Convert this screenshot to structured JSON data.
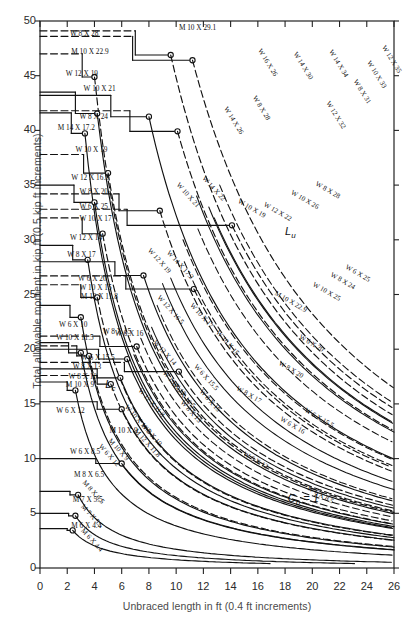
{
  "chart_data": {
    "type": "line",
    "title": "",
    "xlabel": "Unbraced length in ft (0.4 ft increments)",
    "ylabel": "Total allowable moment in kip ft (0.5 kip ft increments)",
    "xlim": [
      0,
      26
    ],
    "ylim": [
      0,
      50
    ],
    "xticks": [
      0,
      2,
      4,
      6,
      8,
      10,
      12,
      14,
      16,
      18,
      20,
      22,
      24,
      26
    ],
    "yticks": [
      0,
      5,
      10,
      15,
      20,
      25,
      30,
      35,
      40,
      45,
      50
    ],
    "grid": false,
    "legend": false,
    "annotations": [
      {
        "text": "C",
        "sub": "b",
        "suffix": " = 1",
        "x": 18.2,
        "y": 6.2,
        "name": "cb-annotation"
      },
      {
        "text": "L",
        "sub": "u",
        "x": 18.0,
        "y": 30.6,
        "name": "lu-annotation"
      },
      {
        "text": "L",
        "sub": "c",
        "x": 5.0,
        "y": 16.4,
        "name": "lc-annotation"
      }
    ],
    "series": [
      {
        "name": "W 8 X 28",
        "style": "dashed",
        "moment": 48.6,
        "lc": 6.8,
        "lu": 11.2,
        "label_x": 2.2,
        "label_y": 48.6
      },
      {
        "name": "M 10 X 22.9",
        "style": "dashed",
        "moment": 47.0,
        "lc": 3.1,
        "lu": 4.0,
        "label_x": 2.3,
        "label_y": 47.0
      },
      {
        "name": "M 10 X 29.1",
        "style": "dashed",
        "moment": 49.1,
        "lc": 7.0,
        "lu": 9.6,
        "label_x": 10.2,
        "label_y": 49.2
      },
      {
        "name": "W 12 X 19",
        "style": "solid",
        "moment": 43.5,
        "lc": 2.6,
        "lu": 4.2,
        "label_x": 1.9,
        "label_y": 45.0
      },
      {
        "name": "W 10 X 21",
        "style": "solid",
        "moment": 43.2,
        "lc": 5.2,
        "lu": 8.0,
        "label_x": 3.2,
        "label_y": 43.6
      },
      {
        "name": "W 8 X 24",
        "style": "dashed",
        "moment": 41.8,
        "lc": 6.6,
        "lu": 10.1,
        "label_x": 2.9,
        "label_y": 41.0
      },
      {
        "name": "M 14 X 17.2",
        "style": "solid",
        "moment": 41.6,
        "lc": 2.3,
        "lu": 3.3,
        "label_x": 1.3,
        "label_y": 40.0
      },
      {
        "name": "W 10 X 19",
        "style": "dashed",
        "moment": 37.8,
        "lc": 3.2,
        "lu": 5.0,
        "label_x": 2.6,
        "label_y": 38.0
      },
      {
        "name": "W 12 X 16.5",
        "style": "solid",
        "moment": 35.0,
        "lc": 2.5,
        "lu": 4.0,
        "label_x": 2.3,
        "label_y": 35.5
      },
      {
        "name": "W 8 X 20",
        "style": "dashed",
        "moment": 34.2,
        "lc": 5.8,
        "lu": 8.8,
        "label_x": 2.9,
        "label_y": 34.2
      },
      {
        "name": "W 6 X 25",
        "style": "dashed",
        "moment": 32.8,
        "lc": 6.4,
        "lu": 14.1,
        "label_x": 2.9,
        "label_y": 32.8
      },
      {
        "name": "W 10 X 17",
        "style": "dashed",
        "moment": 32.0,
        "lc": 3.1,
        "lu": 4.6,
        "label_x": 2.9,
        "label_y": 31.7
      },
      {
        "name": "W 12 X 14",
        "style": "solid",
        "moment": 29.5,
        "lc": 2.4,
        "lu": 3.5,
        "label_x": 2.2,
        "label_y": 30.0
      },
      {
        "name": "W 8 X 17",
        "style": "solid",
        "moment": 28.0,
        "lc": 5.5,
        "lu": 7.6,
        "label_x": 2.0,
        "label_y": 28.4
      },
      {
        "name": "W 6 X 20",
        "style": "dashed",
        "moment": 26.7,
        "lc": 6.3,
        "lu": 11.3,
        "label_x": 2.8,
        "label_y": 26.2
      },
      {
        "name": "W 10 X 15",
        "style": "dashed",
        "moment": 25.9,
        "lc": 3.0,
        "lu": 4.2,
        "label_x": 2.9,
        "label_y": 25.4
      },
      {
        "name": "M 12 X 11.8",
        "style": "solid",
        "moment": 24.0,
        "lc": 2.2,
        "lu": 3.0,
        "label_x": 3.0,
        "label_y": 24.6
      },
      {
        "name": "W 6 X 16",
        "style": "dashed",
        "moment": 21.2,
        "lc": 4.4,
        "lu": 7.1,
        "label_x": 5.5,
        "label_y": 21.2
      },
      {
        "name": "W 6 X 10",
        "style": "solid",
        "moment": 20.6,
        "lc": 2.1,
        "lu": 3.0,
        "label_x": 1.4,
        "label_y": 22.0
      },
      {
        "name": "W 10 X 11.5",
        "style": "dashed",
        "moment": 20.3,
        "lc": 2.7,
        "lu": 3.6,
        "label_x": 1.2,
        "label_y": 20.8
      },
      {
        "name": "W 8 X 15",
        "style": "solid",
        "moment": 20.0,
        "lc": 4.3,
        "lu": 6.4,
        "label_x": 4.6,
        "label_y": 21.4
      },
      {
        "name": "W 6 X 15.5",
        "style": "dashed",
        "moment": 18.8,
        "lc": 6.2,
        "lu": 10.2,
        "label_x": 3.0,
        "label_y": 19.0
      },
      {
        "name": "W 8 X 13",
        "style": "solid",
        "moment": 18.2,
        "lc": 4.2,
        "lu": 5.9,
        "label_x": 2.4,
        "label_y": 18.2
      },
      {
        "name": "W 8 X 10",
        "style": "dashed",
        "moment": 17.6,
        "lc": 4.2,
        "lu": 5.2,
        "label_x": 2.1,
        "label_y": 17.3
      },
      {
        "name": "M 10 X 9",
        "style": "solid",
        "moment": 17.0,
        "lc": 2.0,
        "lu": 2.6,
        "label_x": 1.9,
        "label_y": 16.5
      },
      {
        "name": "W 6 X 12",
        "style": "solid",
        "moment": 15.2,
        "lc": 4.2,
        "lu": 6.0,
        "label_x": 1.2,
        "label_y": 14.2
      },
      {
        "name": "W 6 X 8.5",
        "style": "solid",
        "moment": 10.0,
        "lc": 4.1,
        "lu": 6.0,
        "label_x": 2.2,
        "label_y": 10.4
      },
      {
        "name": "M 8 X 6.5",
        "style": "solid",
        "moment": 7.0,
        "lc": 2.2,
        "lu": 2.8,
        "label_x": 2.5,
        "label_y": 8.3
      },
      {
        "name": "M 7 X 5.5",
        "style": "solid",
        "moment": 5.0,
        "lc": 2.1,
        "lu": 2.6,
        "label_x": 2.4,
        "label_y": 6.0
      },
      {
        "name": "M 6 X 4.4",
        "style": "solid",
        "moment": 3.6,
        "lc": 2.0,
        "lu": 2.4,
        "label_x": 2.3,
        "label_y": 3.7
      },
      {
        "name": "M 10 X 9 (curve)",
        "style": "solid",
        "moment": 0,
        "lc": 0,
        "lu": 0,
        "label_x": 5.1,
        "label_y": 12.3
      },
      {
        "name": "W 16 X 26",
        "style": "solid",
        "curve_only": true,
        "label_x": 16.0,
        "label_y": 47.3
      },
      {
        "name": "W 14 X 30",
        "style": "solid",
        "curve_only": true,
        "label_x": 18.6,
        "label_y": 47.0
      },
      {
        "name": "W 14 X 34",
        "style": "dashed",
        "curve_only": true,
        "label_x": 21.2,
        "label_y": 47.2
      },
      {
        "name": "W 12 X 35",
        "style": "dashed",
        "curve_only": true,
        "label_x": 25.1,
        "label_y": 47.6
      },
      {
        "name": "W 10 X 33",
        "style": "solid",
        "curve_only": true,
        "label_x": 24.0,
        "label_y": 46.2
      },
      {
        "name": "W 8 X 31",
        "style": "solid",
        "curve_only": true,
        "label_x": 23.0,
        "label_y": 44.5
      },
      {
        "name": "W 12 X 32",
        "style": "dashed",
        "curve_only": true,
        "label_x": 21.0,
        "label_y": 42.5
      },
      {
        "name": "W 8 X 28",
        "style": "solid",
        "curve_only": true,
        "label_x": 15.6,
        "label_y": 43.0
      },
      {
        "name": "W 14 X 26",
        "style": "dashed",
        "curve_only": true,
        "label_x": 13.5,
        "label_y": 42.0
      },
      {
        "name": "W 10 X 21 (c)",
        "style": "solid",
        "curve_only": true,
        "label_x": 10.0,
        "label_y": 35.0
      },
      {
        "name": "W 14 X 22",
        "style": "solid",
        "curve_only": true,
        "label_x": 11.9,
        "label_y": 35.6
      },
      {
        "name": "W 10 X 19 (c)",
        "style": "dashed",
        "curve_only": true,
        "label_x": 14.5,
        "label_y": 33.4
      },
      {
        "name": "W 12 X 22",
        "style": "solid",
        "curve_only": true,
        "label_x": 16.4,
        "label_y": 33.1
      },
      {
        "name": "W 8 X 28 (c2)",
        "style": "solid",
        "curve_only": true,
        "label_x": 20.2,
        "label_y": 35.0
      },
      {
        "name": "W 10 X 26",
        "style": "dashed",
        "curve_only": true,
        "label_x": 18.4,
        "label_y": 34.2
      },
      {
        "name": "W 6 X 25 (c)",
        "style": "dashed",
        "curve_only": true,
        "label_x": 22.4,
        "label_y": 27.4
      },
      {
        "name": "W 8 X 24 (c)",
        "style": "solid",
        "curve_only": true,
        "label_x": 21.3,
        "label_y": 26.7
      },
      {
        "name": "W 10 X 25",
        "style": "dashed",
        "curve_only": true,
        "label_x": 20.0,
        "label_y": 25.8
      },
      {
        "name": "M 10 X 22.9 (c)",
        "style": "dashed",
        "curve_only": true,
        "label_x": 17.2,
        "label_y": 25.0
      },
      {
        "name": "W 6 X 20 (c)",
        "style": "solid",
        "curve_only": true,
        "label_x": 19.0,
        "label_y": 21.0
      },
      {
        "name": "W 8 X 20 (c)",
        "style": "dashed",
        "curve_only": true,
        "label_x": 17.5,
        "label_y": 18.6
      },
      {
        "name": "W 8 X 17 (c)",
        "style": "solid",
        "curve_only": true,
        "label_x": 14.4,
        "label_y": 16.3
      },
      {
        "name": "W 6 X 15.5 (c)",
        "style": "solid",
        "curve_only": true,
        "label_x": 19.4,
        "label_y": 14.3
      },
      {
        "name": "W 6 X 16 (c)",
        "style": "dashed",
        "curve_only": true,
        "label_x": 17.6,
        "label_y": 13.5
      },
      {
        "name": "W 6 X 12 (c)",
        "style": "solid",
        "curve_only": true,
        "label_x": 14.9,
        "label_y": 10.3
      },
      {
        "name": "W 6 X 8.5 (c)",
        "style": "solid",
        "curve_only": true,
        "label_x": 19.6,
        "label_y": 7.2
      },
      {
        "name": "W 12 X 19 (c)",
        "style": "dashed",
        "curve_only": true,
        "label_x": 7.9,
        "label_y": 29.0
      },
      {
        "name": "W 12 X 16.5 (c)",
        "style": "solid",
        "curve_only": true,
        "label_x": 8.6,
        "label_y": 24.7
      },
      {
        "name": "W 12 X 14 (c)",
        "style": "dashed",
        "curve_only": true,
        "label_x": 8.3,
        "label_y": 20.6
      },
      {
        "name": "W 10 X 17 (c)",
        "style": "solid",
        "curve_only": true,
        "label_x": 11.0,
        "label_y": 24.0
      },
      {
        "name": "W 10 X 15 (c)",
        "style": "dashed",
        "curve_only": true,
        "label_x": 12.9,
        "label_y": 21.5
      },
      {
        "name": "W 8 X 15 (c)",
        "style": "solid",
        "curve_only": true,
        "label_x": 11.7,
        "label_y": 16.1
      },
      {
        "name": "W 8 X 13 (c)",
        "style": "dashed",
        "curve_only": true,
        "label_x": 10.3,
        "label_y": 15.1
      },
      {
        "name": "W 12 X 11.8",
        "style": "solid",
        "curve_only": true,
        "label_x": 7.2,
        "label_y": 16.2
      },
      {
        "name": "M 12 X 11.8 (c)",
        "style": "solid",
        "curve_only": true,
        "label_x": 6.9,
        "label_y": 12.5
      },
      {
        "name": "W 10 X 11.5 (c)",
        "style": "solid",
        "curve_only": true,
        "label_x": 6.2,
        "label_y": 14.7
      },
      {
        "name": "W 8 X 10 (c)",
        "style": "dashed",
        "curve_only": true,
        "label_x": 7.4,
        "label_y": 13.0
      },
      {
        "name": "M 10 X 9 (c2)",
        "style": "solid",
        "curve_only": true,
        "label_x": 5.0,
        "label_y": 11.6
      },
      {
        "name": "W 6 X 12 (c2)",
        "style": "solid",
        "curve_only": true,
        "label_x": 4.3,
        "label_y": 11.1
      },
      {
        "name": "M 8 X 6.5 (c)",
        "style": "solid",
        "curve_only": true,
        "label_x": 3.1,
        "label_y": 7.8
      },
      {
        "name": "M 7 X 5.5 (c)",
        "style": "solid",
        "curve_only": true,
        "label_x": 3.0,
        "label_y": 5.6
      },
      {
        "name": "M 6 X 4.4 (c)",
        "style": "solid",
        "curve_only": true,
        "label_x": 3.0,
        "label_y": 3.4
      },
      {
        "name": "W 6 X 16.5",
        "style": "solid",
        "curve_only": true,
        "label_x": 9.6,
        "label_y": 16.8
      },
      {
        "name": "W 10 X 12",
        "style": "solid",
        "curve_only": true,
        "label_x": 9.0,
        "label_y": 17.8
      },
      {
        "name": "W 6 X 15.5 (c2)",
        "style": "solid",
        "curve_only": true,
        "label_x": 11.3,
        "label_y": 18.4
      },
      {
        "name": "W 14 X 17.2",
        "style": "solid",
        "curve_only": true,
        "label_x": 9.3,
        "label_y": 28.8
      }
    ]
  },
  "axes": {
    "x_title": "Unbraced length in ft (0.4 ft increments)",
    "y_title": "Total allowable moment in kip ft (0.5 kip ft increments)",
    "x_ticklabels": [
      "0",
      "2",
      "4",
      "6",
      "8",
      "10",
      "12",
      "14",
      "16",
      "18",
      "20",
      "22",
      "24",
      "26"
    ],
    "y_ticklabels": [
      "0",
      "5",
      "10",
      "15",
      "20",
      "25",
      "30",
      "35",
      "40",
      "45",
      "50"
    ]
  },
  "colors": {
    "line": "#111111",
    "frame": "#222222",
    "text": "#1a1a1a",
    "axis_title": "#4a4a4a",
    "background": "#ffffff"
  }
}
